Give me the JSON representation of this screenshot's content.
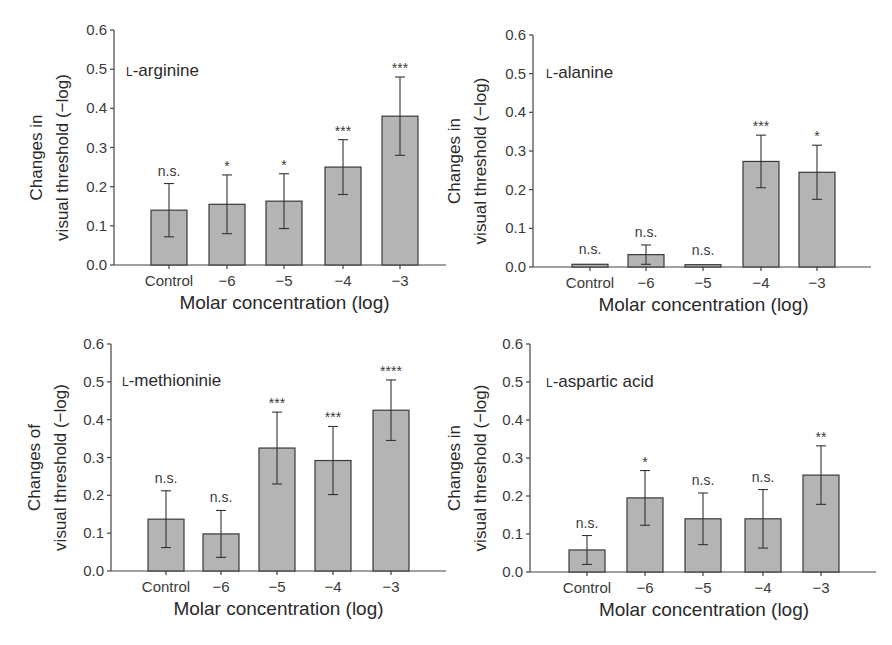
{
  "figure": {
    "y_ticks": [
      "0.0",
      "0.1",
      "0.2",
      "0.3",
      "0.4",
      "0.5",
      "0.6"
    ],
    "x_label": "Molar concentration (log)"
  },
  "chart_data": [
    {
      "type": "bar",
      "title": "L-arginine",
      "categories": [
        "Control",
        "−6",
        "−5",
        "−4",
        "−3"
      ],
      "values": [
        0.14,
        0.155,
        0.163,
        0.25,
        0.38
      ],
      "error": [
        0.068,
        0.075,
        0.07,
        0.07,
        0.1
      ],
      "significance": [
        "n.s.",
        "*",
        "*",
        "***",
        "***"
      ],
      "xlabel": "Molar concentration (log)",
      "ylabel": [
        "Changes in",
        "visual threshold (−log)"
      ],
      "ylim": [
        0,
        0.6
      ],
      "grid": false
    },
    {
      "type": "bar",
      "title": "L-alanine",
      "categories": [
        "Control",
        "−6",
        "−5",
        "−4",
        "−3"
      ],
      "values": [
        0.007,
        0.032,
        0.006,
        0.273,
        0.245
      ],
      "error": [
        0.0,
        0.025,
        0.0,
        0.068,
        0.07
      ],
      "significance": [
        "n.s.",
        "n.s.",
        "n.s.",
        "***",
        "*"
      ],
      "xlabel": "Molar concentration (log)",
      "ylabel": [
        "Changes in",
        "visual threshold (−log)"
      ],
      "ylim": [
        0,
        0.6
      ],
      "grid": false
    },
    {
      "type": "bar",
      "title": "L-methioninie",
      "categories": [
        "Control",
        "−6",
        "−5",
        "−4",
        "−3"
      ],
      "values": [
        0.137,
        0.098,
        0.325,
        0.292,
        0.425
      ],
      "error": [
        0.075,
        0.062,
        0.095,
        0.09,
        0.08
      ],
      "significance": [
        "n.s.",
        "n.s.",
        "***",
        "***",
        "****"
      ],
      "xlabel": "Molar concentration (log)",
      "ylabel": [
        "Changes of",
        "visual threshold (−log)"
      ],
      "ylim": [
        0,
        0.6
      ],
      "grid": false
    },
    {
      "type": "bar",
      "title": "L-aspartic acid",
      "categories": [
        "Control",
        "−6",
        "−5",
        "−4",
        "−3"
      ],
      "values": [
        0.058,
        0.195,
        0.14,
        0.14,
        0.255
      ],
      "error": [
        0.038,
        0.072,
        0.068,
        0.077,
        0.077
      ],
      "significance": [
        "n.s.",
        "*",
        "n.s.",
        "n.s.",
        "**"
      ],
      "xlabel": "Molar concentration (log)",
      "ylabel": [
        "Changes in",
        "visual threshold (−log)"
      ],
      "ylim": [
        0,
        0.6
      ],
      "grid": false
    }
  ],
  "panels": [
    {
      "prefix": "L",
      "name": "-arginine",
      "ylabel1": "Changes in",
      "ylabel2": "visual threshold (−log)"
    },
    {
      "prefix": "L",
      "name": "-alanine",
      "ylabel1": "Changes in",
      "ylabel2": "visual threshold (−log)"
    },
    {
      "prefix": "L",
      "name": "-methioninie",
      "ylabel1": "Changes of",
      "ylabel2": "visual threshold (−log)"
    },
    {
      "prefix": "L",
      "name": "-aspartic acid",
      "ylabel1": "Changes in",
      "ylabel2": "visual threshold (−log)"
    }
  ]
}
